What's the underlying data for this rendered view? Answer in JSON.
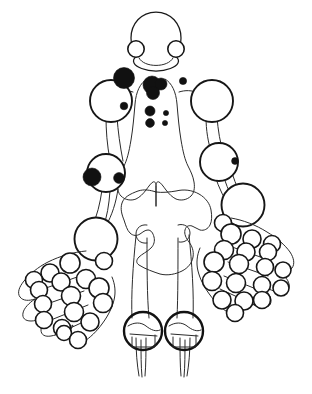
{
  "figure": {
    "caption": "",
    "width": 312,
    "height": 394,
    "background_color": "#ffffff",
    "outline_color": "#1a1a1a",
    "open_joint_fill": "#ffffff",
    "filled_joint_color": "#111111"
  },
  "legend": {
    "open_label": "unaffected joint",
    "filled_label": "affected joint"
  },
  "regions": {
    "skull": "skull",
    "jaw": "temporomandibular joints",
    "shoulders": "shoulder joints",
    "elbows": "elbow joints",
    "wrists": "wrist joints",
    "hands": "hand joints",
    "pelvis": "pelvis",
    "hips": "hip joints",
    "knees": "knee joints",
    "sternum": "sternoclavicular region"
  },
  "counts": {
    "filled_joints": 10,
    "open_joints": 46
  },
  "marks": {
    "filled": [
      {
        "name": "left-acromioclavicular",
        "cx": 124,
        "cy": 78,
        "r": 10.5
      },
      {
        "name": "sternoclavicular-upper",
        "cx": 152,
        "cy": 85,
        "r": 9
      },
      {
        "name": "sternoclavicular-mid",
        "cx": 161,
        "cy": 84,
        "r": 6
      },
      {
        "name": "sternoclavicular-lower",
        "cx": 153,
        "cy": 93,
        "r": 6.5
      },
      {
        "name": "right-clavicle-dot",
        "cx": 183,
        "cy": 81,
        "r": 3.6
      },
      {
        "name": "costochondral-left-upper",
        "cx": 150,
        "cy": 111,
        "r": 5
      },
      {
        "name": "costochondral-left-lower",
        "cx": 150,
        "cy": 123,
        "r": 4.4
      },
      {
        "name": "costochondral-right-upper",
        "cx": 166,
        "cy": 113,
        "r": 2.6
      },
      {
        "name": "costochondral-right-lower",
        "cx": 165,
        "cy": 123,
        "r": 2.6
      },
      {
        "name": "left-shoulder-lateral",
        "cx": 124,
        "cy": 106,
        "r": 3.8
      },
      {
        "name": "left-elbow-medial",
        "cx": 92,
        "cy": 177,
        "r": 9
      },
      {
        "name": "left-elbow-lateral",
        "cx": 119,
        "cy": 178,
        "r": 5.4
      },
      {
        "name": "right-elbow-lateral",
        "cx": 235,
        "cy": 161,
        "r": 3.4
      }
    ]
  }
}
